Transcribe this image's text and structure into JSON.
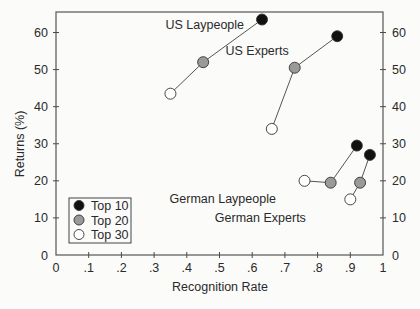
{
  "chart_data": {
    "type": "scatter",
    "title": "",
    "xlabel": "Recognition Rate",
    "ylabel": "Returns (%)",
    "xlim": [
      0,
      1
    ],
    "ylim": [
      0,
      65
    ],
    "x_ticks": [
      "0",
      ".1",
      ".2",
      ".3",
      ".4",
      ".5",
      ".6",
      ".7",
      ".8",
      ".9",
      "1"
    ],
    "y_ticks": [
      "0",
      "10",
      "20",
      "30",
      "40",
      "50",
      "60"
    ],
    "grid": false,
    "legend_position": "lower-left inside",
    "legend": [
      {
        "label": "Top 10",
        "fill": "#111111"
      },
      {
        "label": "Top 20",
        "fill": "#9a9a9a"
      },
      {
        "label": "Top 30",
        "fill": "#ffffff"
      }
    ],
    "series": [
      {
        "name": "US Laypeople",
        "points": [
          {
            "group": "Top 30",
            "x": 0.35,
            "y": 43.5
          },
          {
            "group": "Top 20",
            "x": 0.45,
            "y": 52
          },
          {
            "group": "Top 10",
            "x": 0.63,
            "y": 63.5
          }
        ]
      },
      {
        "name": "US Experts",
        "points": [
          {
            "group": "Top 30",
            "x": 0.66,
            "y": 34
          },
          {
            "group": "Top 20",
            "x": 0.73,
            "y": 50.5
          },
          {
            "group": "Top 10",
            "x": 0.86,
            "y": 59
          }
        ]
      },
      {
        "name": "German Laypeople",
        "points": [
          {
            "group": "Top 30",
            "x": 0.76,
            "y": 20
          },
          {
            "group": "Top 20",
            "x": 0.84,
            "y": 19.5
          },
          {
            "group": "Top 10",
            "x": 0.92,
            "y": 29.5
          }
        ]
      },
      {
        "name": "German Experts",
        "points": [
          {
            "group": "Top 30",
            "x": 0.9,
            "y": 15
          },
          {
            "group": "Top 20",
            "x": 0.93,
            "y": 19.5
          },
          {
            "group": "Top 10",
            "x": 0.96,
            "y": 27
          }
        ]
      }
    ],
    "annotations": [
      {
        "text": "US Laypeople",
        "x": 0.455,
        "y": 62
      },
      {
        "text": "US Experts",
        "x": 0.615,
        "y": 55
      },
      {
        "text": "German Laypeople",
        "x": 0.51,
        "y": 15
      },
      {
        "text": "German Experts",
        "x": 0.625,
        "y": 10
      }
    ]
  }
}
